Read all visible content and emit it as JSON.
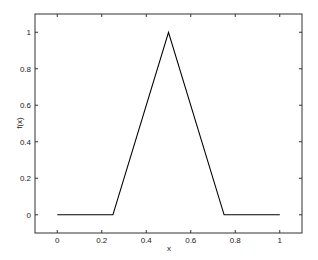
{
  "chart_data": {
    "type": "line",
    "title": "",
    "xlabel": "x",
    "ylabel": "f(x)",
    "xlim": [
      -0.1,
      1.1
    ],
    "ylim": [
      -0.1,
      1.1
    ],
    "grid": false,
    "legend": null,
    "x_ticks": [
      0,
      0.2,
      0.4,
      0.6,
      0.8,
      1
    ],
    "x_tick_labels": [
      "0",
      "0.2",
      "0.4",
      "0.6",
      "0.8",
      "1"
    ],
    "y_ticks": [
      0,
      0.2,
      0.4,
      0.6,
      0.8,
      1
    ],
    "y_tick_labels": [
      "0",
      "0.2",
      "0.4",
      "0.6",
      "0.8",
      "1"
    ],
    "series": [
      {
        "name": "f(x)",
        "color": "#000000",
        "x": [
          0,
          0.25,
          0.5,
          0.75,
          1
        ],
        "y": [
          0,
          0,
          1,
          0,
          0
        ]
      }
    ]
  }
}
